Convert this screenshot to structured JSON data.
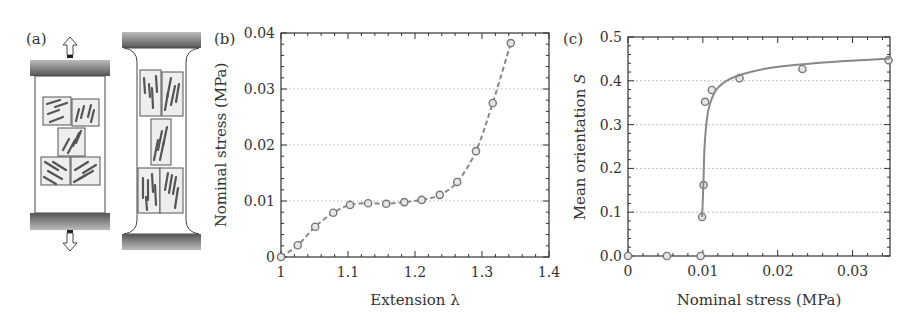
{
  "panels": {
    "a": {
      "label": "(a)",
      "left_specimen": {
        "state": "unstretched",
        "domains": 5
      },
      "right_specimen": {
        "state": "stretched",
        "domains": 5
      },
      "arrow_up": "arrow-up-icon",
      "arrow_down": "arrow-down-icon"
    },
    "b": {
      "label": "(b)"
    },
    "c": {
      "label": "(c)"
    }
  },
  "colors": {
    "axis": "#333333",
    "grid": "#aaaaaa",
    "series": "#888888",
    "marker": "#777777",
    "clamp_dark": "#555555",
    "clamp_light": "#bbbbbb",
    "domain_fill": "#eeeeee",
    "rod": "#555555"
  },
  "chart_data": [
    {
      "panel": "(b)",
      "type": "line",
      "title": "",
      "xlabel": "Extension λ",
      "ylabel": "Nominal stress (MPa)",
      "xlim": [
        1.0,
        1.4
      ],
      "ylim": [
        0,
        0.04
      ],
      "xticks": [
        1,
        1.1,
        1.2,
        1.3,
        1.4
      ],
      "xtick_labels": [
        "1",
        "1.1",
        "1.2",
        "1.3",
        "1.4"
      ],
      "yticks": [
        0,
        0.01,
        0.02,
        0.03,
        0.04
      ],
      "ytick_labels": [
        "0",
        "0.01",
        "0.02",
        "0.03",
        "0.04"
      ],
      "grid": "horizontal dotted at 0.01, 0.02, 0.03",
      "legend": null,
      "series": [
        {
          "name": "Nominal stress",
          "style": "dashed line with open circle markers",
          "x": [
            1.0,
            1.025,
            1.051,
            1.078,
            1.103,
            1.13,
            1.157,
            1.184,
            1.21,
            1.237,
            1.263,
            1.291,
            1.316,
            1.343
          ],
          "y": [
            0.0,
            0.0021,
            0.0054,
            0.0079,
            0.0093,
            0.0096,
            0.0095,
            0.0098,
            0.0102,
            0.0111,
            0.0134,
            0.0189,
            0.0275,
            0.0382
          ]
        }
      ]
    },
    {
      "panel": "(c)",
      "type": "scatter",
      "title": "",
      "xlabel": "Nominal stress (MPa)",
      "ylabel": "Mean orientation S",
      "xlim": [
        0,
        0.035
      ],
      "ylim": [
        0.0,
        0.5
      ],
      "xticks": [
        0,
        0.01,
        0.02,
        0.03
      ],
      "xtick_labels": [
        "0",
        "0.01",
        "0.02",
        "0.03"
      ],
      "yticks": [
        0.0,
        0.1,
        0.2,
        0.3,
        0.4,
        0.5
      ],
      "ytick_labels": [
        "0.0",
        "0.1",
        "0.2",
        "0.3",
        "0.4",
        "0.5"
      ],
      "grid": "horizontal dotted at 0.1, 0.2, 0.3, 0.4",
      "legend": null,
      "series": [
        {
          "name": "Measured S",
          "style": "open circle markers",
          "x": [
            0.0,
            0.0052,
            0.0097,
            0.0099,
            0.0101,
            0.0103,
            0.0112,
            0.0149,
            0.0233,
            0.0348
          ],
          "y": [
            0.0,
            0.0,
            0.0,
            0.089,
            0.162,
            0.352,
            0.379,
            0.406,
            0.427,
            0.447
          ]
        },
        {
          "name": "Fit",
          "style": "solid line",
          "x": [
            0.0099,
            0.01,
            0.0101,
            0.0102,
            0.0104,
            0.0107,
            0.0112,
            0.012,
            0.0135,
            0.0155,
            0.0185,
            0.023,
            0.029,
            0.035
          ],
          "y": [
            0.089,
            0.13,
            0.18,
            0.24,
            0.29,
            0.33,
            0.36,
            0.384,
            0.403,
            0.416,
            0.428,
            0.437,
            0.445,
            0.451
          ]
        }
      ]
    }
  ]
}
